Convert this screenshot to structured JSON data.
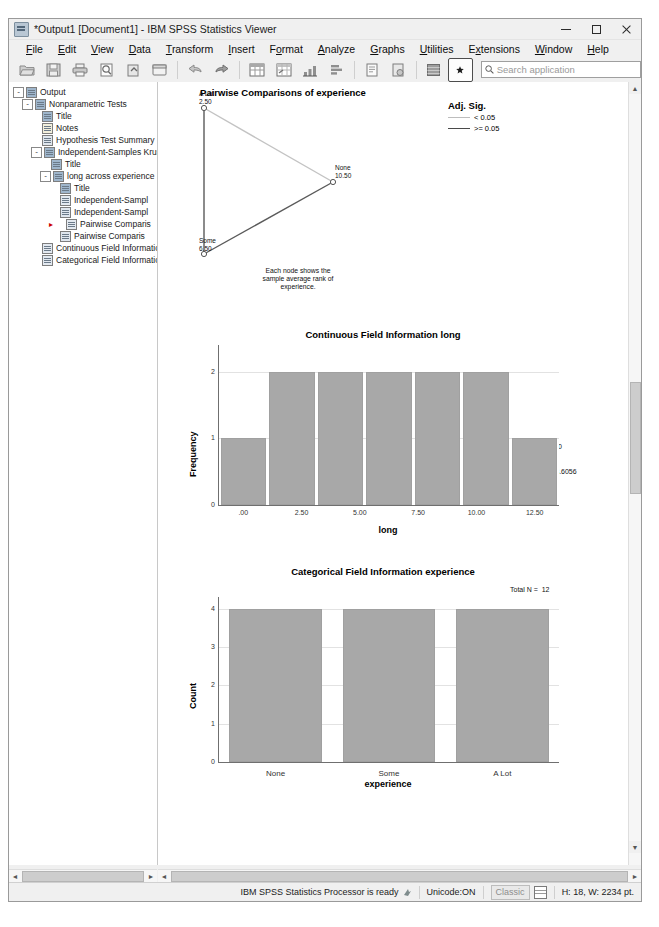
{
  "window": {
    "title": "*Output1 [Document1] - IBM SPSS Statistics Viewer",
    "icon": "spss-viewer-icon",
    "minimize": "–",
    "maximize": "□",
    "close": "✕"
  },
  "menubar": {
    "items": [
      {
        "label": "File",
        "mnemonic": "F"
      },
      {
        "label": "Edit",
        "mnemonic": "E"
      },
      {
        "label": "View",
        "mnemonic": "V"
      },
      {
        "label": "Data",
        "mnemonic": "D"
      },
      {
        "label": "Transform",
        "mnemonic": "T"
      },
      {
        "label": "Insert",
        "mnemonic": "I"
      },
      {
        "label": "Format",
        "mnemonic": "o"
      },
      {
        "label": "Analyze",
        "mnemonic": "A"
      },
      {
        "label": "Graphs",
        "mnemonic": "G"
      },
      {
        "label": "Utilities",
        "mnemonic": "U"
      },
      {
        "label": "Extensions",
        "mnemonic": "x"
      },
      {
        "label": "Window",
        "mnemonic": "W"
      },
      {
        "label": "Help",
        "mnemonic": "H"
      }
    ]
  },
  "toolbar": {
    "buttons": [
      "open-file-icon",
      "save-icon",
      "print-icon",
      "print-preview-icon",
      "export-icon",
      "recall-dialog-icon",
      "undo-icon",
      "redo-icon",
      "goto-data-icon",
      "goto-case-icon",
      "variables-icon",
      "run-descriptives-icon",
      "select-cases-icon",
      "weight-cases-icon",
      "show-hide-icon",
      "insert-marker-icon"
    ],
    "search": {
      "icon": "search-icon",
      "placeholder": "Search application",
      "value": ""
    }
  },
  "outline": {
    "items": [
      {
        "label": "Output",
        "depth": 0,
        "expander": "-",
        "icon": "output-icon"
      },
      {
        "label": "Nonparametric Tests",
        "depth": 1,
        "expander": "-",
        "icon": "log-icon"
      },
      {
        "label": "Title",
        "depth": 2,
        "expander": "",
        "icon": "title-icon"
      },
      {
        "label": "Notes",
        "depth": 2,
        "expander": "",
        "icon": "notes-icon"
      },
      {
        "label": "Hypothesis Test Summary",
        "depth": 2,
        "expander": "",
        "icon": "table-icon"
      },
      {
        "label": "Independent-Samples Kruskal",
        "depth": 2,
        "expander": "-",
        "icon": "log-icon"
      },
      {
        "label": "Title",
        "depth": 3,
        "expander": "",
        "icon": "title-icon"
      },
      {
        "label": "long across experience",
        "depth": 3,
        "expander": "-",
        "icon": "log-icon"
      },
      {
        "label": "Title",
        "depth": 4,
        "expander": "",
        "icon": "title-icon"
      },
      {
        "label": "Independent-Sampl",
        "depth": 4,
        "expander": "",
        "icon": "chart-icon"
      },
      {
        "label": "Independent-Sampl",
        "depth": 4,
        "expander": "",
        "icon": "table-icon"
      },
      {
        "label": "Pairwise Comparis",
        "depth": 4,
        "expander": "",
        "icon": "chart-icon",
        "selected": true
      },
      {
        "label": "Pairwise Comparis",
        "depth": 4,
        "expander": "",
        "icon": "table-icon"
      },
      {
        "label": "Continuous Field Information",
        "depth": 2,
        "expander": "",
        "icon": "chart-icon"
      },
      {
        "label": "Categorical Field Information",
        "depth": 2,
        "expander": "",
        "icon": "chart-icon"
      }
    ]
  },
  "statusbar": {
    "processor": "IBM SPSS Statistics Processor is ready",
    "processor_icon": "processor-ready-icon",
    "unicode": "Unicode:ON",
    "mode": "Classic",
    "grid_icon": "grid-icon",
    "dimensions": "H: 18, W: 2234 pt."
  },
  "chart_data": [
    {
      "type": "network",
      "title": "Pairwise Comparisons of experience",
      "nodes": [
        {
          "label": "A Lot",
          "value": "2.50"
        },
        {
          "label": "None",
          "value": "10.50"
        },
        {
          "label": "Some",
          "value": "6.50"
        }
      ],
      "edges": [
        {
          "from": "A Lot",
          "to": "None",
          "sig": ">= 0.05",
          "color": "#c0c0c0"
        },
        {
          "from": "A Lot",
          "to": "Some",
          "sig": "< 0.05",
          "color": "#4a4a4a"
        },
        {
          "from": "Some",
          "to": "None",
          "sig": "< 0.05",
          "color": "#4a4a4a"
        }
      ],
      "legend": {
        "title": "Adj. Sig.",
        "entries": [
          {
            "label": "< 0.05",
            "style": "light"
          },
          {
            "label": ">= 0.05",
            "style": "dark"
          }
        ]
      },
      "caption": "Each node shows the\nsample average rank of\nexperience."
    },
    {
      "type": "bar",
      "title": "Continuous Field Information long",
      "xlabel": "long",
      "ylabel": "Frequency",
      "xticks": [
        ".00",
        "2.50",
        "5.00",
        "7.50",
        "10.00",
        "12.50"
      ],
      "yticks": [
        "0",
        "1",
        "2"
      ],
      "ylim": [
        0,
        2.4
      ],
      "categories": [
        "0-2",
        "2-4",
        "4-6",
        "6-8",
        "8-10",
        "10-12",
        "12-14"
      ],
      "values": [
        1,
        2,
        2,
        2,
        2,
        2,
        1
      ],
      "grid": true,
      "annotations": [
        "N = 12",
        "Min = 1.00",
        "Max = 12.00",
        "Mean = 6.500",
        "Std. Dev. = 3.6056"
      ]
    },
    {
      "type": "bar",
      "title": "Categorical Field Information experience",
      "xlabel": "experience",
      "ylabel": "Count",
      "categories": [
        "None",
        "Some",
        "A Lot"
      ],
      "values": [
        4,
        4,
        4
      ],
      "yticks": [
        "0",
        "1",
        "2",
        "3",
        "4"
      ],
      "ylim": [
        0,
        4.3
      ],
      "grid": true,
      "annotations": [
        "Total N =  12"
      ]
    }
  ]
}
